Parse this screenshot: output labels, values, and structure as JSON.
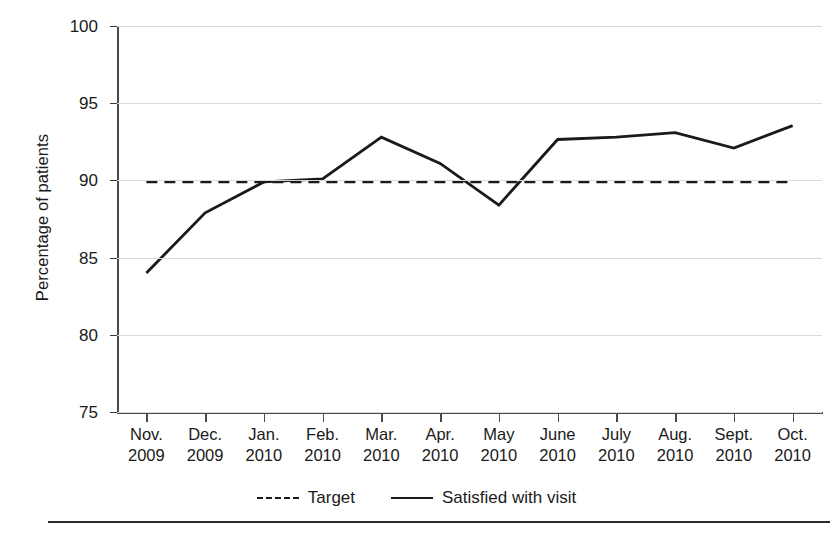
{
  "chart_data": {
    "type": "line",
    "title": "",
    "xlabel": "",
    "ylabel": "Percentage of patients",
    "ylim": [
      75,
      100
    ],
    "yticks": [
      75,
      80,
      85,
      90,
      95,
      100
    ],
    "ytick_labels": [
      "75",
      "80",
      "85",
      "90",
      "95",
      "100"
    ],
    "grid": "horizontal",
    "legend_position": "bottom-center",
    "categories": [
      "Nov. 2009",
      "Dec. 2009",
      "Jan. 2010",
      "Feb. 2010",
      "Mar. 2010",
      "Apr. 2010",
      "May 2010",
      "June 2010",
      "July 2010",
      "Aug. 2010",
      "Sept. 2010",
      "Oct. 2010"
    ],
    "category_lines": [
      [
        "Nov.",
        "2009"
      ],
      [
        "Dec.",
        "2009"
      ],
      [
        "Jan.",
        "2010"
      ],
      [
        "Feb.",
        "2010"
      ],
      [
        "Mar.",
        "2010"
      ],
      [
        "Apr.",
        "2010"
      ],
      [
        "May",
        "2010"
      ],
      [
        "June",
        "2010"
      ],
      [
        "July",
        "2010"
      ],
      [
        "Aug.",
        "2010"
      ],
      [
        "Sept.",
        "2010"
      ],
      [
        "Oct.",
        "2010"
      ]
    ],
    "series": [
      {
        "name": "Target",
        "style": "dashed",
        "color": "#1a1a1a",
        "values": [
          89.9,
          89.9,
          89.9,
          89.9,
          89.9,
          89.9,
          89.9,
          89.9,
          89.9,
          89.9,
          89.9,
          89.9
        ]
      },
      {
        "name": "Satisfied with visit",
        "style": "solid",
        "color": "#1a1a1a",
        "values": [
          84.0,
          87.9,
          89.9,
          90.1,
          92.8,
          91.1,
          88.4,
          92.65,
          92.8,
          93.1,
          92.1,
          93.55
        ]
      }
    ]
  },
  "legend": {
    "target_label": "Target",
    "satisfied_label": "Satisfied with visit"
  },
  "axis": {
    "y_title": "Percentage of patients"
  }
}
